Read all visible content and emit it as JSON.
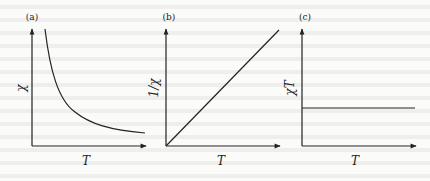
{
  "figure": {
    "panels": [
      {
        "id": "a",
        "label": "(a)",
        "y_label": "χ",
        "x_label": "T",
        "curve": "hyperbola (χ ∝ 1/T)"
      },
      {
        "id": "b",
        "label": "(b)",
        "y_label": "1/χ",
        "x_label": "T",
        "curve": "straight line through origin"
      },
      {
        "id": "c",
        "label": "(c)",
        "y_label": "χT",
        "x_label": "T",
        "curve": "horizontal constant line"
      }
    ]
  },
  "colors": {
    "ink": "#222222",
    "background": "#fbfbfa"
  }
}
